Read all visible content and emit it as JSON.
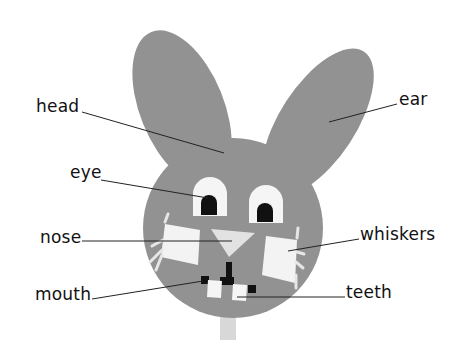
{
  "figure": {
    "colors": {
      "body": "#929292",
      "paper": "#f5f5f5",
      "features_dark": "#111111",
      "stick": "#d8d8d8",
      "leader_line": "#222222",
      "label_text": "#111111"
    }
  },
  "labels": {
    "head": "head",
    "ear": "ear",
    "eye": "eye",
    "nose": "nose",
    "whiskers": "whiskers",
    "mouth": "mouth",
    "teeth": "teeth"
  }
}
